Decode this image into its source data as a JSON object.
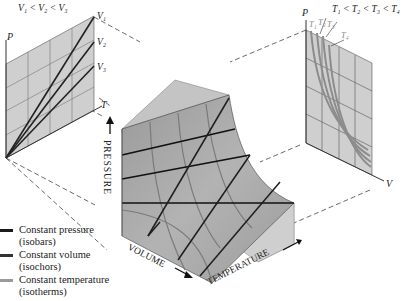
{
  "left_panel": {
    "title": "V₁ < V₂ < V₃",
    "axis_y": "P",
    "axis_x": "T",
    "curve_labels": [
      "V₁",
      "V₂",
      "V₃"
    ]
  },
  "right_panel": {
    "title": "T₁ < T₂ < T₃ < T₄",
    "axis_y": "P",
    "axis_x": "V",
    "curve_labels": [
      "T₁",
      "T₂",
      "T₃",
      "T₄"
    ]
  },
  "main_surface": {
    "axis_pressure": "PRESSURE",
    "axis_volume": "VOLUME",
    "axis_temperature": "TEMPERATURE"
  },
  "legend": {
    "items": [
      {
        "label": "Constant pressure",
        "sub": "(isobars)",
        "color": "#1a1a1a"
      },
      {
        "label": "Constant volume",
        "sub": "(isochors)",
        "color": "#333333"
      },
      {
        "label": "Constant temperature",
        "sub": "(isotherms)",
        "color": "#9a9a9a"
      }
    ]
  },
  "colors": {
    "panel_fill": "#cfcfcf",
    "surface_fill": "#a9a9a9",
    "isobar": "#1a1a1a",
    "isochor": "#262626",
    "isotherm": "#8c8c8c"
  }
}
